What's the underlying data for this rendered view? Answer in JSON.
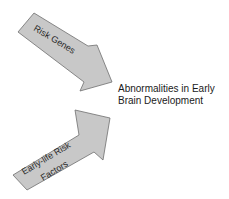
{
  "diagram": {
    "arrows": [
      {
        "id": "risk-genes",
        "label_lines": [
          "Risk Genes"
        ],
        "direction": "down-right",
        "fill": "#c8c8c8",
        "stroke": "#6e6e6e"
      },
      {
        "id": "early-life-risk-factors",
        "label_lines": [
          "Early-life Risk",
          "Factors"
        ],
        "direction": "up-right",
        "fill": "#c8c8c8",
        "stroke": "#6e6e6e"
      }
    ],
    "outcome": {
      "lines": [
        "Abnormalities in Early",
        "Brain Development"
      ]
    }
  }
}
